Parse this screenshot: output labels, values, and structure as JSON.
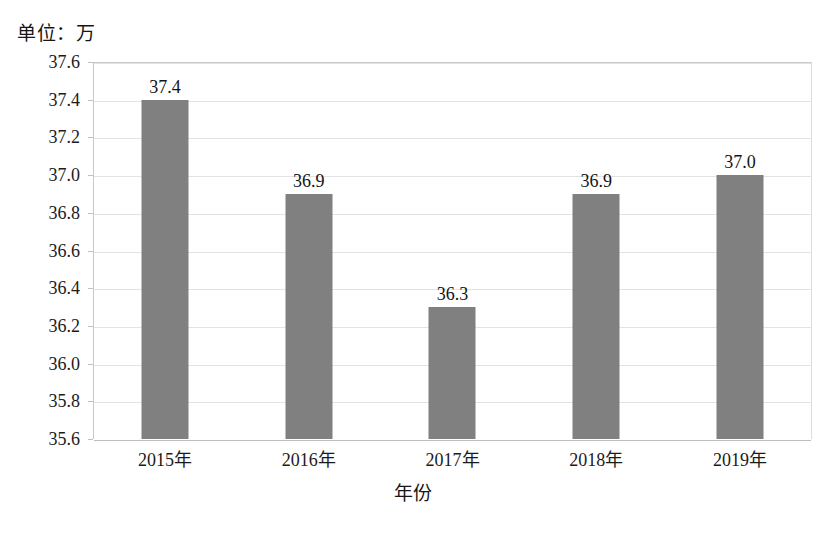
{
  "unit_label": "单位：万",
  "chart_data": {
    "type": "bar",
    "title": "",
    "subtitle": "",
    "unit_note": "单位：万",
    "categories": [
      "2015年",
      "2016年",
      "2017年",
      "2018年",
      "2019年"
    ],
    "values": [
      37.4,
      36.9,
      36.3,
      36.9,
      37.0
    ],
    "data_labels": [
      "37.4",
      "36.9",
      "36.3",
      "36.9",
      "37.0"
    ],
    "xlabel": "年份",
    "ylabel": "",
    "ylim": [
      35.6,
      37.6
    ],
    "ytick_step": 0.2,
    "ytick_labels": [
      "37.6",
      "37.4",
      "37.2",
      "37.0",
      "36.8",
      "36.6",
      "36.4",
      "36.2",
      "36.0",
      "35.8",
      "35.6"
    ],
    "ytick_values": [
      37.6,
      37.4,
      37.2,
      37.0,
      36.8,
      36.6,
      36.4,
      36.2,
      36.0,
      35.8,
      35.6
    ],
    "grid": true,
    "grid_axis": "y",
    "legend": false,
    "legend_position": "none",
    "series_color": "#808080",
    "gridline_color": "#e3e3e3",
    "axis_color": "#c0c0c0"
  }
}
